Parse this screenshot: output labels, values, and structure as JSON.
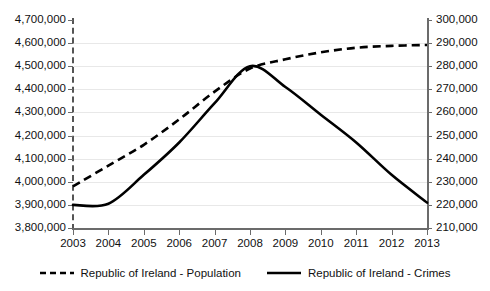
{
  "chart_data": {
    "type": "line",
    "title": "",
    "subtitle": "",
    "xlabel": "",
    "ylabel": "",
    "grid": true,
    "legend_position": "bottom",
    "x": [
      "2003",
      "2004",
      "2005",
      "2006",
      "2007",
      "2008",
      "2009",
      "2010",
      "2011",
      "2012",
      "2013"
    ],
    "categories": [
      "2003",
      "2004",
      "2005",
      "2006",
      "2007",
      "2008",
      "2009",
      "2010",
      "2011",
      "2012",
      "2013"
    ],
    "axes": {
      "left": {
        "name": "Population",
        "min": 3800000,
        "max": 4700000,
        "step": 100000,
        "ticks": [
          "3,800,000",
          "3,900,000",
          "4,000,000",
          "4,100,000",
          "4,200,000",
          "4,300,000",
          "4,400,000",
          "4,500,000",
          "4,600,000",
          "4,700,000"
        ],
        "tick_values": [
          3800000,
          3900000,
          4000000,
          4100000,
          4200000,
          4300000,
          4400000,
          4500000,
          4600000,
          4700000
        ]
      },
      "right": {
        "name": "Crimes",
        "min": 210000,
        "max": 300000,
        "step": 10000,
        "ticks": [
          "210,000",
          "220,000",
          "230,000",
          "240,000",
          "250,000",
          "260,000",
          "270,000",
          "280,000",
          "290,000",
          "300,000"
        ],
        "tick_values": [
          210000,
          220000,
          230000,
          240000,
          250000,
          260000,
          270000,
          280000,
          290000,
          300000
        ]
      }
    },
    "series": [
      {
        "name": "Republic of Ireland - Population",
        "axis": "left",
        "style": "dashed",
        "color": "#000000",
        "values": [
          3980000,
          4070000,
          4160000,
          4270000,
          4390000,
          4490000,
          4530000,
          4560000,
          4580000,
          4588000,
          4592000
        ]
      },
      {
        "name": "Republic of Ireland - Crimes",
        "axis": "right",
        "style": "solid",
        "color": "#000000",
        "values": [
          220000,
          220500,
          233000,
          247000,
          264000,
          280000,
          271000,
          259000,
          247000,
          233000,
          221000
        ]
      }
    ]
  },
  "legend": {
    "items": [
      {
        "label": "Republic of Ireland - Population",
        "style": "dashed"
      },
      {
        "label": "Republic of Ireland - Crimes",
        "style": "solid"
      }
    ]
  }
}
